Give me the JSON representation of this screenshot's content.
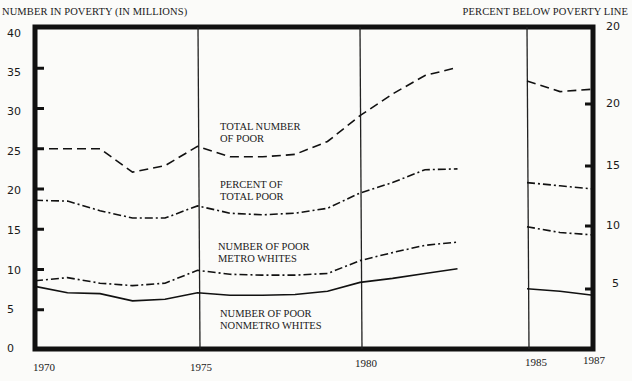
{
  "chart_data": {
    "type": "line",
    "title": "",
    "ylabel": "NUMBER IN POVERTY (IN MILLIONS)",
    "ylabel_right": "PERCENT BELOW POVERTY LINE",
    "xlabel": "",
    "ylim": [
      0,
      40
    ],
    "y_ticks": [
      "0",
      "5",
      "10",
      "15",
      "20",
      "25",
      "30",
      "35",
      "40"
    ],
    "y_right_ticks": [
      "5",
      "10",
      "15",
      "20",
      "20"
    ],
    "x_ticks": [
      "1970",
      "1975",
      "1980",
      "1985",
      "1987"
    ],
    "grid": false,
    "axis_break": "between 1983 and 1985",
    "x": [
      1970,
      1971,
      1972,
      1973,
      1974,
      1975,
      1976,
      1977,
      1978,
      1979,
      1980,
      1981,
      1982,
      1983,
      1985,
      1986,
      1987
    ],
    "series": [
      {
        "name": "TOTAL NUMBER OF POOR",
        "style": "dashed",
        "values": [
          25.0,
          25.0,
          25.0,
          22.1,
          22.9,
          25.3,
          24.0,
          24.0,
          24.3,
          25.9,
          29.1,
          31.8,
          34.1,
          35.1,
          33.4,
          32.1,
          32.4
        ]
      },
      {
        "name": "PERCENT OF TOTAL POOR",
        "style": "dash-dot",
        "values": [
          18.6,
          18.5,
          17.3,
          16.4,
          16.4,
          17.9,
          17.0,
          16.8,
          17.0,
          17.6,
          19.5,
          20.8,
          22.4,
          22.5,
          20.8,
          20.4,
          20.0
        ]
      },
      {
        "name": "NUMBER OF POOR METRO WHITES",
        "style": "dash-dot",
        "values": [
          8.6,
          9.0,
          8.3,
          8.0,
          8.3,
          9.9,
          9.4,
          9.3,
          9.3,
          9.5,
          11.1,
          12.1,
          13.0,
          13.4,
          15.3,
          14.6,
          14.3
        ]
      },
      {
        "name": "NUMBER OF POOR NONMETRO WHITES",
        "style": "solid",
        "values": [
          7.9,
          7.1,
          7.0,
          6.1,
          6.3,
          7.1,
          6.8,
          6.8,
          6.9,
          7.3,
          8.4,
          8.9,
          9.5,
          10.1,
          7.6,
          7.3,
          6.8
        ]
      }
    ]
  },
  "labels": {
    "ylabel_left": "NUMBER IN POVERTY (IN MILLIONS)",
    "ylabel_right": "PERCENT BELOW POVERTY LINE",
    "left_ticks": [
      {
        "text": "40",
        "y": 27
      },
      {
        "text": "35",
        "y": 66
      },
      {
        "text": "30",
        "y": 105
      },
      {
        "text": "25",
        "y": 145
      },
      {
        "text": "20",
        "y": 184
      },
      {
        "text": "15",
        "y": 224
      },
      {
        "text": "10",
        "y": 264
      },
      {
        "text": "5",
        "y": 303
      },
      {
        "text": "0",
        "y": 342
      }
    ],
    "right_ticks": [
      {
        "text": "20",
        "y": 20
      },
      {
        "text": "20",
        "y": 97
      },
      {
        "text": "15",
        "y": 159
      },
      {
        "text": "10",
        "y": 219
      },
      {
        "text": "5",
        "y": 277
      }
    ],
    "x_ticks": [
      {
        "text": "1970",
        "x": 33
      },
      {
        "text": "1975",
        "x": 190
      },
      {
        "text": "1980",
        "x": 355
      },
      {
        "text": "1985",
        "x": 525
      },
      {
        "text": "1987",
        "x": 583
      }
    ],
    "curve_total": [
      "TOTAL NUMBER",
      "OF POOR"
    ],
    "curve_percent": [
      "PERCENT OF",
      "TOTAL POOR"
    ],
    "curve_metro": [
      "NUMBER OF POOR",
      "METRO WHITES"
    ],
    "curve_nonmetro": [
      "NUMBER OF POOR",
      "NONMETRO WHITES"
    ]
  }
}
